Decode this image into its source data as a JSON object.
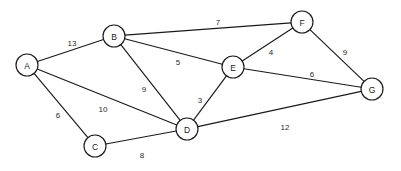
{
  "diagram": {
    "type": "node-link-graph",
    "width": 401,
    "height": 171,
    "background_color": "#ffffff",
    "stroke_color": "#1a1a1a",
    "node_fill_color": "#ffffff",
    "node_radius": 11,
    "nodes": [
      {
        "id": "A",
        "label": "A",
        "x": 27,
        "y": 65
      },
      {
        "id": "B",
        "label": "B",
        "x": 114,
        "y": 36
      },
      {
        "id": "C",
        "label": "C",
        "x": 95,
        "y": 146
      },
      {
        "id": "D",
        "label": "D",
        "x": 187,
        "y": 129
      },
      {
        "id": "E",
        "label": "E",
        "x": 233,
        "y": 67
      },
      {
        "id": "F",
        "label": "F",
        "x": 302,
        "y": 22
      },
      {
        "id": "G",
        "label": "G",
        "x": 372,
        "y": 89
      }
    ],
    "edges": [
      {
        "id": "A-B",
        "source": "A",
        "target": "B",
        "weight": "13",
        "label_x": 72,
        "label_y": 43
      },
      {
        "id": "A-C",
        "source": "A",
        "target": "C",
        "weight": "6",
        "label_x": 58,
        "label_y": 115
      },
      {
        "id": "A-D",
        "source": "A",
        "target": "D",
        "weight": "10",
        "label_x": 103,
        "label_y": 109
      },
      {
        "id": "B-F",
        "source": "B",
        "target": "F",
        "weight": "7",
        "label_x": 218,
        "label_y": 22
      },
      {
        "id": "B-E",
        "source": "B",
        "target": "E",
        "weight": "5",
        "label_x": 178,
        "label_y": 62
      },
      {
        "id": "B-D",
        "source": "B",
        "target": "D",
        "weight": "9",
        "label_x": 144,
        "label_y": 89
      },
      {
        "id": "C-D",
        "source": "C",
        "target": "D",
        "weight": "8",
        "label_x": 142,
        "label_y": 155
      },
      {
        "id": "D-E",
        "source": "D",
        "target": "E",
        "weight": "3",
        "label_x": 200,
        "label_y": 100
      },
      {
        "id": "D-G",
        "source": "D",
        "target": "G",
        "weight": "12",
        "label_x": 285,
        "label_y": 127
      },
      {
        "id": "E-F",
        "source": "E",
        "target": "F",
        "weight": "4",
        "label_x": 271,
        "label_y": 52
      },
      {
        "id": "E-G",
        "source": "E",
        "target": "G",
        "weight": "6",
        "label_x": 312,
        "label_y": 74
      },
      {
        "id": "F-G",
        "source": "F",
        "target": "G",
        "weight": "9",
        "label_x": 345,
        "label_y": 52
      }
    ]
  }
}
